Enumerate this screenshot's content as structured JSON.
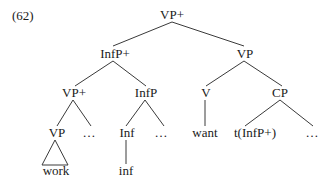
{
  "example_number": "(62)",
  "nodes": {
    "root": "VP+",
    "infp_plus": "InfP+",
    "vp_right": "VP",
    "vp_plus_lower": "VP+",
    "infp": "InfP",
    "v": "V",
    "cp": "CP",
    "vp_inner": "VP",
    "ellipsis_1": "…",
    "inf": "Inf",
    "ellipsis_2": "…",
    "want": "want",
    "trace": "t(InfP+)",
    "ellipsis_3": "…",
    "work": "work",
    "inf_leaf": "inf"
  }
}
